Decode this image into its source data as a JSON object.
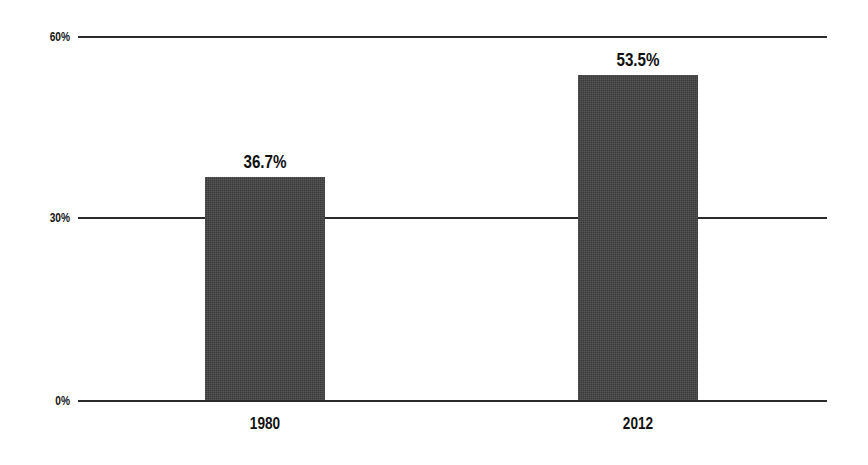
{
  "chart_data": {
    "type": "bar",
    "title": "",
    "subtitle": "",
    "xlabel": "",
    "ylabel": "",
    "categories": [
      "1980",
      "2012"
    ],
    "values": [
      36.7,
      53.5
    ],
    "value_labels": [
      "36.7%",
      "53.5%"
    ],
    "ylim": [
      0,
      60
    ],
    "yticks": [
      0,
      30,
      60
    ],
    "ytick_labels": [
      "0%",
      "30%",
      "60%"
    ],
    "grid": true,
    "legend": "none",
    "series": [
      {
        "name": "",
        "values": [
          36.7,
          53.5
        ]
      }
    ]
  },
  "axes": {
    "y": {
      "ticks": [
        {
          "label": "60%",
          "value": 60
        },
        {
          "label": "30%",
          "value": 30
        },
        {
          "label": "0%",
          "value": 0
        }
      ]
    },
    "x": {
      "ticks": [
        {
          "label": "1980"
        },
        {
          "label": "2012"
        }
      ]
    }
  },
  "bars": [
    {
      "category": "1980",
      "value": 36.7,
      "label": "36.7%"
    },
    {
      "category": "2012",
      "value": 53.5,
      "label": "53.5%"
    }
  ],
  "colors": {
    "bar_fill": "#414141",
    "gridline": "#2b2b2b",
    "text": "#101010",
    "background": "#ffffff"
  }
}
